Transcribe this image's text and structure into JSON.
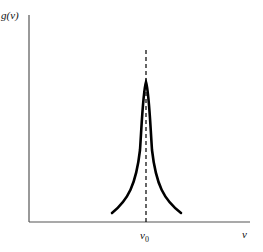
{
  "diagram": {
    "type": "line-shape profile",
    "y_axis_label": "g(ν)",
    "x_axis_label": "ν",
    "center_label": "ν",
    "center_label_subscript": "0"
  },
  "colors": {
    "axes": "#555555",
    "curve": "#000000",
    "dashed": "#000000"
  }
}
